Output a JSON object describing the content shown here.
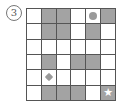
{
  "puzzle": {
    "label": "3",
    "label_glyph": "③",
    "rows": 6,
    "cols": 6,
    "colors": {
      "shaded": "#a3a3a3",
      "empty": "#ffffff",
      "grid_line": "#555555",
      "marker": "#9a9a9a"
    },
    "cells": [
      [
        {
          "shaded": false
        },
        {
          "shaded": true
        },
        {
          "shaded": true
        },
        {
          "shaded": false
        },
        {
          "shaded": false,
          "marker": "circle"
        },
        {
          "shaded": true
        }
      ],
      [
        {
          "shaded": false
        },
        {
          "shaded": true
        },
        {
          "shaded": true
        },
        {
          "shaded": false
        },
        {
          "shaded": true
        },
        {
          "shaded": false
        }
      ],
      [
        {
          "shaded": false
        },
        {
          "shaded": false
        },
        {
          "shaded": false
        },
        {
          "shaded": false
        },
        {
          "shaded": false
        },
        {
          "shaded": false
        }
      ],
      [
        {
          "shaded": false
        },
        {
          "shaded": true
        },
        {
          "shaded": false
        },
        {
          "shaded": true
        },
        {
          "shaded": true
        },
        {
          "shaded": false
        }
      ],
      [
        {
          "shaded": false
        },
        {
          "shaded": false,
          "marker": "diamond"
        },
        {
          "shaded": false
        },
        {
          "shaded": false
        },
        {
          "shaded": false
        },
        {
          "shaded": false
        }
      ],
      [
        {
          "shaded": false
        },
        {
          "shaded": true
        },
        {
          "shaded": true
        },
        {
          "shaded": true
        },
        {
          "shaded": false
        },
        {
          "shaded": true,
          "marker": "star"
        }
      ]
    ],
    "markers": {
      "star": "★"
    }
  }
}
